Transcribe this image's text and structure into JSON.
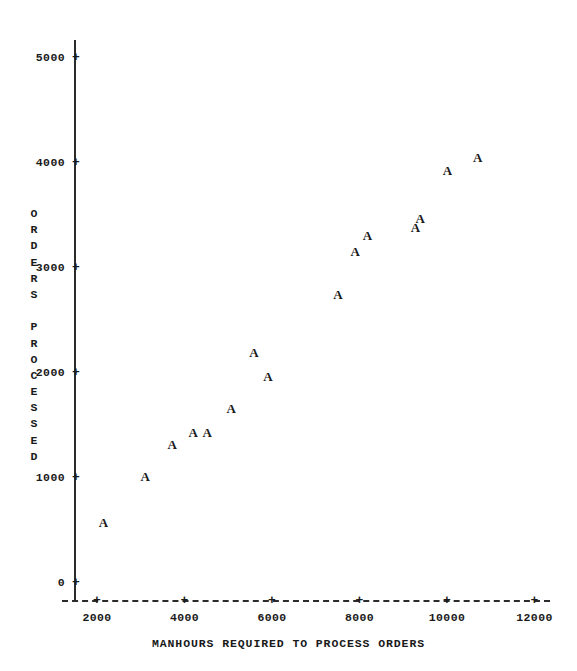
{
  "chart_data": {
    "type": "scatter",
    "title": "",
    "xlabel": "MANHOURS REQUIRED TO PROCESS ORDERS",
    "ylabel": "ORDERS PROCESSED",
    "ylabel_lines": [
      "O",
      "R",
      "D",
      "E",
      "R",
      "S",
      "",
      "P",
      "R",
      "O",
      "C",
      "E",
      "S",
      "S",
      "E",
      "D"
    ],
    "marker_symbol": "A",
    "point_label": "A",
    "grid": false,
    "legend": false,
    "xlim": [
      1500,
      12200
    ],
    "ylim": [
      0,
      5200
    ],
    "xticks": [
      2000,
      4000,
      6000,
      8000,
      10000,
      12000
    ],
    "xtick_labels": [
      "2000",
      "4000",
      "6000",
      "8000",
      "10000",
      "12000"
    ],
    "yticks": [
      0,
      1000,
      2000,
      3000,
      4000,
      5000
    ],
    "ytick_labels": [
      "0",
      "1000",
      "2000",
      "3000",
      "4000",
      "5000"
    ],
    "tick_glyph": "+",
    "x": [
      2150,
      3100,
      3720,
      4200,
      4520,
      5070,
      5590,
      5910,
      7510,
      7900,
      8180,
      9280,
      9390,
      10010,
      10700
    ],
    "y": [
      580,
      1020,
      1320,
      1440,
      1440,
      1670,
      2200,
      1970,
      2750,
      3160,
      3310,
      3390,
      3480,
      3930,
      4060
    ],
    "points": [
      {
        "x": 2150,
        "y": 580
      },
      {
        "x": 3100,
        "y": 1020
      },
      {
        "x": 3720,
        "y": 1320
      },
      {
        "x": 4200,
        "y": 1440
      },
      {
        "x": 4520,
        "y": 1440
      },
      {
        "x": 5070,
        "y": 1670
      },
      {
        "x": 5590,
        "y": 2200
      },
      {
        "x": 5910,
        "y": 1970
      },
      {
        "x": 7510,
        "y": 2750
      },
      {
        "x": 7900,
        "y": 3160
      },
      {
        "x": 8180,
        "y": 3310
      },
      {
        "x": 9280,
        "y": 3390
      },
      {
        "x": 9390,
        "y": 3480
      },
      {
        "x": 10010,
        "y": 3930
      },
      {
        "x": 10700,
        "y": 4060
      }
    ],
    "colors": {
      "axis": "#2b2b2b",
      "text": "#1a1a1a",
      "marker": "#1a1a1a",
      "background": "#ffffff"
    }
  }
}
